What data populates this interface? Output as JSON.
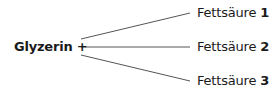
{
  "diagram": {
    "source_label": "Glyzerin +",
    "products": [
      {
        "label": "Fettsäure",
        "number": "1"
      },
      {
        "label": "Fettsäure",
        "number": "2"
      },
      {
        "label": "Fettsäure",
        "number": "3"
      }
    ],
    "line_color": "#555555",
    "text_color": "#1a1a1a"
  }
}
